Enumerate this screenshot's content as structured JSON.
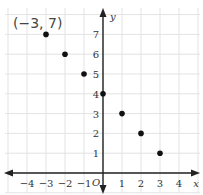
{
  "chart_data": {
    "type": "scatter",
    "title": "",
    "xlabel": "x",
    "ylabel": "y",
    "origin_label": "O",
    "xlim": [
      -5,
      5
    ],
    "ylim": [
      -1,
      8
    ],
    "grid": true,
    "x_ticks": [
      "−4",
      "−3",
      "−2",
      "−1",
      "1",
      "2",
      "3",
      "4"
    ],
    "y_ticks": [
      "1",
      "2",
      "3",
      "4",
      "5",
      "6",
      "7"
    ],
    "points": [
      {
        "x": -3,
        "y": 7
      },
      {
        "x": -2,
        "y": 6
      },
      {
        "x": -1,
        "y": 5
      },
      {
        "x": 0,
        "y": 4
      },
      {
        "x": 1,
        "y": 3
      },
      {
        "x": 2,
        "y": 2
      },
      {
        "x": 3,
        "y": 1
      }
    ],
    "annotations": [
      {
        "text": "(−3, 7)",
        "x": -3,
        "y": 7
      }
    ]
  },
  "colors": {
    "grid": "#e3e3e3",
    "axis": "#222222",
    "point": "#111111"
  }
}
